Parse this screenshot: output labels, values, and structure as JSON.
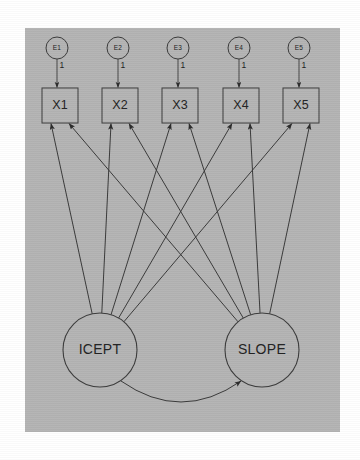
{
  "figure": {
    "panel": {
      "x": 25,
      "y": 28,
      "width": 315,
      "height": 404,
      "fill": "#b4b4b4"
    },
    "canvas": {
      "width": 360,
      "height": 460,
      "background": "#ffffff"
    },
    "stroke_color": "#3a3a3a",
    "text_color": "#222222"
  },
  "errors": [
    {
      "id": "e1",
      "label": "E1",
      "cx": 57,
      "cy": 48,
      "r": 11,
      "loading_label": "1"
    },
    {
      "id": "e2",
      "label": "E2",
      "cx": 118,
      "cy": 48,
      "r": 11,
      "loading_label": "1"
    },
    {
      "id": "e3",
      "label": "E3",
      "cx": 178,
      "cy": 48,
      "r": 11,
      "loading_label": "1"
    },
    {
      "id": "e4",
      "label": "E4",
      "cx": 239,
      "cy": 48,
      "r": 11,
      "loading_label": "1"
    },
    {
      "id": "e5",
      "label": "E5",
      "cx": 299,
      "cy": 48,
      "r": 11,
      "loading_label": "1"
    }
  ],
  "indicators": [
    {
      "id": "x1",
      "label": "X1",
      "x": 42,
      "y": 88,
      "width": 36,
      "height": 35
    },
    {
      "id": "x2",
      "label": "X2",
      "x": 102,
      "y": 88,
      "width": 36,
      "height": 35
    },
    {
      "id": "x3",
      "label": "X3",
      "x": 162,
      "y": 88,
      "width": 36,
      "height": 35
    },
    {
      "id": "x4",
      "label": "X4",
      "x": 223,
      "y": 88,
      "width": 36,
      "height": 35
    },
    {
      "id": "x5",
      "label": "X5",
      "x": 283,
      "y": 88,
      "width": 36,
      "height": 35
    }
  ],
  "latents": [
    {
      "id": "icept",
      "label": "ICEPT",
      "cx": 100,
      "cy": 350,
      "r": 37
    },
    {
      "id": "slope",
      "label": "SLOPE",
      "cx": 262,
      "cy": 350,
      "r": 37
    }
  ],
  "covariance": {
    "id": "icept-slope-covariance",
    "from": "icept",
    "to": "slope",
    "double_headed": true,
    "start": {
      "x": 121,
      "y": 381
    },
    "end": {
      "x": 241,
      "y": 381
    },
    "sag": 42
  },
  "loadings": {
    "icept_to_indicators": [
      {
        "target": "x1",
        "arrow_x": 51
      },
      {
        "target": "x2",
        "arrow_x": 111
      },
      {
        "target": "x3",
        "arrow_x": 171
      },
      {
        "target": "x4",
        "arrow_x": 232
      },
      {
        "target": "x5",
        "arrow_x": 292
      }
    ],
    "slope_to_indicators": [
      {
        "target": "x1",
        "arrow_x": 69
      },
      {
        "target": "x2",
        "arrow_x": 129
      },
      {
        "target": "x3",
        "arrow_x": 189
      },
      {
        "target": "x4",
        "arrow_x": 250
      },
      {
        "target": "x5",
        "arrow_x": 310
      }
    ]
  }
}
